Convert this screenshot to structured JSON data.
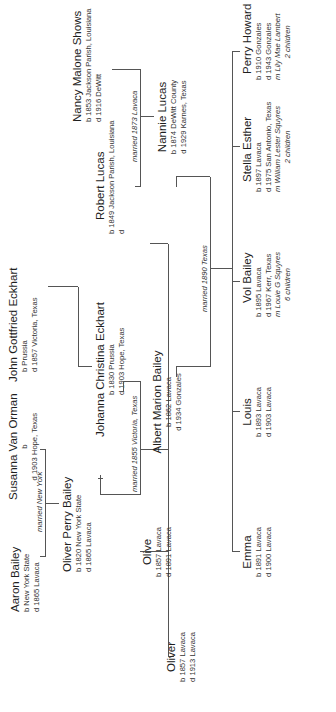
{
  "chart": {
    "orientation": "rotated 90 degrees counter-clockwise",
    "line_color": "#555555",
    "generations": [
      {
        "level": 1,
        "people": {
          "aaron": {
            "name": "Aaron Bailey",
            "born": "b New York State",
            "died": "d 1865 Lavaca"
          },
          "susanna": {
            "name": "Susanna Van Orman",
            "born": "b",
            "died": "d 1903 Hope, Texas"
          },
          "john": {
            "name": "John Gottfried Eckhart",
            "born": "b Prussia",
            "died": "d 1857 Victoria, Texas"
          }
        },
        "marriages": {
          "aaron_susanna": "married New York"
        }
      },
      {
        "level": 2,
        "people": {
          "oliver_perry": {
            "name": "Oliver Perry Bailey",
            "born": "b 1820 New York State",
            "died": "d 1865 Lavaca"
          },
          "johanna": {
            "name": "Johanna Christina Eckhart",
            "born": "b 1830 Prussia",
            "died": "d 1903 Hope, Texas"
          },
          "robert": {
            "name": "Robert Lucas",
            "born": "b 1849 Jackson Parish, Louisiana",
            "died": "d"
          },
          "nancy": {
            "name": "Nancy Malone Shows",
            "born": "b 1853 Jackson Parish, Louisiana",
            "died": "d 1916 DeWitt"
          }
        },
        "marriages": {
          "oliver_johanna": "married 1855 Victoria, Texas",
          "robert_nancy": "married 1873 Lavaca"
        }
      },
      {
        "level": 3,
        "people": {
          "oliver": {
            "name": "Oliver",
            "born": "b 1857 Lavaca",
            "died": "d 1913 Lavaca"
          },
          "olive": {
            "name": "Olive",
            "born": "b 1857 Lavaca",
            "died": "d 1891 Lavaca"
          },
          "albert": {
            "name": "Albert Marion Bailey",
            "born": "b 1862 Lavaca",
            "died": "d 1934 Gonzales"
          },
          "nannie": {
            "name": "Nannie Lucas",
            "born": "b 1874 DeWitt County",
            "died": "d 1929 Karnes, Texas"
          }
        },
        "marriages": {
          "albert_nannie": "married 1890 Texas"
        }
      },
      {
        "level": 4,
        "people": {
          "emma": {
            "name": "Emma",
            "born": "b 1891 Lavaca",
            "died": "d 1900 Lavaca"
          },
          "louis": {
            "name": "Louis",
            "born": "b 1893 Lavaca",
            "died": "d 1903 Lavaca"
          },
          "vol": {
            "name": "Vol Bailey",
            "born": "b 1895 Lavaca",
            "died": "d 1967 Kerr, Texas",
            "spouse": "m Louie G Squyres",
            "children": "6 children"
          },
          "stella": {
            "name": "Stella Esther",
            "born": "b 1897 Lavaca",
            "died": "d 1975 San Antonio, Texas",
            "spouse": "m William Lester Squyres",
            "children": "2 children"
          },
          "perry": {
            "name": "Perry Howard",
            "born": "b 1910 Gonzales",
            "died": "d 1943 Gonzales",
            "spouse": "m Lily Mae Lambert",
            "children": "2 children"
          }
        }
      }
    ]
  }
}
